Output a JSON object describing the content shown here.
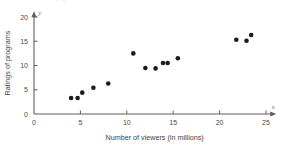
{
  "title_sliver": "y    g",
  "chart_data": {
    "type": "scatter",
    "title": "",
    "xlabel": "Number of viewers (in millions)",
    "ylabel": "Ratings of programs",
    "x_axis_symbol": "x",
    "y_axis_symbol": "y",
    "xlim": [
      0,
      26
    ],
    "ylim": [
      0,
      21
    ],
    "xticks": [
      0,
      5,
      10,
      15,
      20,
      25
    ],
    "yticks": [
      0,
      5,
      10,
      15,
      20
    ],
    "xtick_labels": [
      "0",
      "5",
      "10",
      "15",
      "20",
      "25"
    ],
    "ytick_labels": [
      "0",
      "5",
      "10",
      "15",
      "20"
    ],
    "grid": false,
    "legend": "none",
    "point_color": "#1b1b1b",
    "axis_color": "#5e5e5e",
    "background_color": "#ffffff",
    "points": [
      {
        "x": 4.0,
        "y": 3.3
      },
      {
        "x": 4.7,
        "y": 3.3
      },
      {
        "x": 5.2,
        "y": 4.4
      },
      {
        "x": 6.4,
        "y": 5.4
      },
      {
        "x": 8.0,
        "y": 6.3
      },
      {
        "x": 10.7,
        "y": 12.5
      },
      {
        "x": 12.0,
        "y": 9.5
      },
      {
        "x": 13.1,
        "y": 9.4
      },
      {
        "x": 13.9,
        "y": 10.5
      },
      {
        "x": 14.4,
        "y": 10.5
      },
      {
        "x": 15.5,
        "y": 11.5
      },
      {
        "x": 21.8,
        "y": 15.3
      },
      {
        "x": 22.9,
        "y": 15.1
      },
      {
        "x": 23.4,
        "y": 16.3
      }
    ]
  }
}
